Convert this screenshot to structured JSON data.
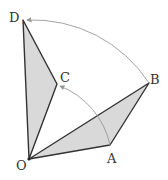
{
  "diagram": {
    "points": {
      "O": {
        "label": "O",
        "x": 29,
        "y": 159
      },
      "A": {
        "label": "A",
        "x": 110,
        "y": 145
      },
      "B": {
        "label": "B",
        "x": 149,
        "y": 83
      },
      "C": {
        "label": "C",
        "x": 57,
        "y": 84
      },
      "D": {
        "label": "D",
        "x": 23,
        "y": 20
      }
    },
    "triangles": [
      {
        "name": "OAB",
        "fill": "#d9d9d9"
      },
      {
        "name": "OCD",
        "fill": "#d9d9d9"
      }
    ],
    "arcs": [
      {
        "name": "arc-A-to-C",
        "from": "A",
        "to": "C"
      },
      {
        "name": "arc-B-to-D",
        "from": "B",
        "to": "D"
      }
    ],
    "colors": {
      "stroke": "#333333",
      "arc": "#999999",
      "fill": "#d9d9d9"
    }
  }
}
